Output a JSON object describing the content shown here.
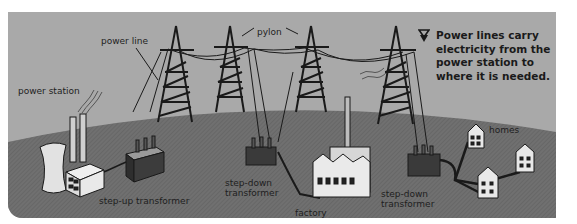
{
  "diagram": {
    "caption": "Power lines carry electricity from the power station to where it is needed.",
    "caption_icon": "down-triangle-marker-icon",
    "labels": {
      "power_line": "power line",
      "pylon": "pylon",
      "power_station": "power station",
      "step_up_transformer": "step-up transformer",
      "step_down_transformer_1_line1": "step-down",
      "step_down_transformer_1_line2": "transformer",
      "factory": "factory",
      "step_down_transformer_2_line1": "step-down",
      "step_down_transformer_2_line2": "transformer",
      "homes": "homes"
    },
    "colors": {
      "sky": "#a9a9a9",
      "ground": "#6f6f6f",
      "ink": "#1a1a1a",
      "building": "#e6e6e6",
      "transformer": "#3c3c3c"
    }
  }
}
